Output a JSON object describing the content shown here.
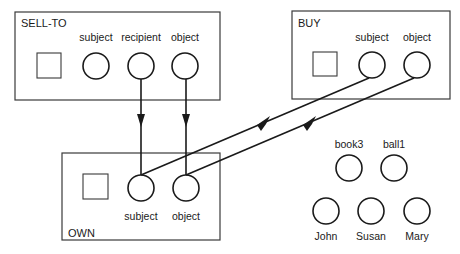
{
  "frames": [
    {
      "id": "sell-to",
      "title": "SELL-TO",
      "slots": [
        {
          "label": "subject"
        },
        {
          "label": "recipient"
        },
        {
          "label": "object"
        }
      ]
    },
    {
      "id": "buy",
      "title": "BUY",
      "slots": [
        {
          "label": "subject"
        },
        {
          "label": "object"
        }
      ]
    },
    {
      "id": "own",
      "title": "OWN",
      "slots": [
        {
          "label": "subject"
        },
        {
          "label": "object"
        }
      ]
    }
  ],
  "entities": {
    "objects": [
      {
        "label": "book3"
      },
      {
        "label": "ball1"
      }
    ],
    "people": [
      {
        "label": "John"
      },
      {
        "label": "Susan"
      },
      {
        "label": "Mary"
      }
    ]
  },
  "links": [
    {
      "from": "SELL-TO.recipient",
      "to": "OWN.subject"
    },
    {
      "from": "SELL-TO.object",
      "to": "OWN.object"
    },
    {
      "from": "BUY.subject",
      "to": "OWN.subject"
    },
    {
      "from": "BUY.object",
      "to": "OWN.object"
    }
  ]
}
